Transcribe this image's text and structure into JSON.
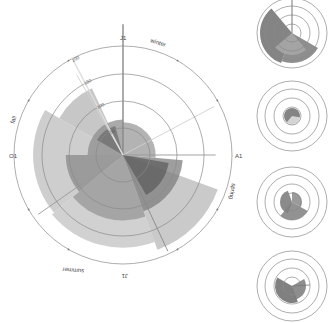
{
  "chart_data": [
    {
      "type": "radial-area",
      "title": "",
      "center": [
        123,
        155
      ],
      "radial_ticks": [
        50,
        100,
        150,
        200
      ],
      "radial_max": 200,
      "angular_labels": [
        {
          "text": "J1",
          "angle_deg": 0
        },
        {
          "text": "A1",
          "angle_deg": 90
        },
        {
          "text": "J1",
          "angle_deg": 180
        },
        {
          "text": "O1",
          "angle_deg": 270
        }
      ],
      "season_labels": [
        {
          "text": "winter",
          "angle_deg": 20
        },
        {
          "text": "spring",
          "angle_deg": 110
        },
        {
          "text": "summer",
          "angle_deg": 200
        },
        {
          "text": "fall",
          "angle_deg": 290
        }
      ],
      "sectors": [
        {
          "start": 300,
          "end": 335,
          "r0": 0,
          "r1": 135,
          "fill": "#b4b4b4"
        },
        {
          "start": 230,
          "end": 300,
          "r0": 0,
          "r1": 165,
          "fill": "#bdbdbd"
        },
        {
          "start": 160,
          "end": 230,
          "r0": 0,
          "r1": 170,
          "fill": "#c2c2c2"
        },
        {
          "start": 110,
          "end": 160,
          "r0": 0,
          "r1": 185,
          "fill": "#b8b8b8"
        },
        {
          "start": 270,
          "end": 360,
          "r0": 0,
          "r1": 65,
          "fill": "#8e8e8e"
        },
        {
          "start": 0,
          "end": 95,
          "r0": 0,
          "r1": 60,
          "fill": "#9a9a9a"
        },
        {
          "start": 95,
          "end": 160,
          "r0": 0,
          "r1": 110,
          "fill": "#7e7e7e"
        },
        {
          "start": 160,
          "end": 230,
          "r0": 0,
          "r1": 120,
          "fill": "#969696"
        },
        {
          "start": 230,
          "end": 270,
          "r0": 0,
          "r1": 105,
          "fill": "#8a8a8a"
        },
        {
          "start": 300,
          "end": 345,
          "r0": 0,
          "r1": 55,
          "fill": "#6e6e6e"
        },
        {
          "start": 100,
          "end": 150,
          "r0": 0,
          "r1": 85,
          "fill": "#5e5e5e"
        }
      ],
      "spokes": [
        {
          "angle_deg": 0,
          "length": 240,
          "color": "#888"
        },
        {
          "angle_deg": 62,
          "length": 190,
          "color": "#cfcfcf"
        },
        {
          "angle_deg": 90,
          "length": 170,
          "color": "#999"
        },
        {
          "angle_deg": 330,
          "length": 170,
          "color": "#d0d0d0"
        },
        {
          "angle_deg": 235,
          "length": 190,
          "color": "#999"
        },
        {
          "angle_deg": 155,
          "length": 195,
          "color": "#888"
        }
      ]
    },
    {
      "type": "radial-area",
      "panel": 1,
      "center": [
        292,
        33
      ],
      "rings": [
        9,
        18,
        27,
        35
      ]
    },
    {
      "type": "radial-area",
      "panel": 2,
      "center": [
        292,
        116
      ],
      "rings": [
        9,
        18,
        27,
        35
      ]
    },
    {
      "type": "radial-area",
      "panel": 3,
      "center": [
        292,
        202
      ],
      "rings": [
        9,
        18,
        27,
        35
      ]
    },
    {
      "type": "radial-area",
      "panel": 4,
      "center": [
        292,
        286
      ],
      "rings": [
        9,
        18,
        27,
        35
      ]
    }
  ],
  "labels": {
    "top_month": "J1",
    "right_month": "A1",
    "bottom_month": "J1",
    "left_month": "O1",
    "winter": "winter",
    "spring": "spring",
    "summer": "summer",
    "fall": "fall",
    "tick_200": "200",
    "tick_150": "150",
    "tick_100": "100",
    "tick_50": "50"
  }
}
